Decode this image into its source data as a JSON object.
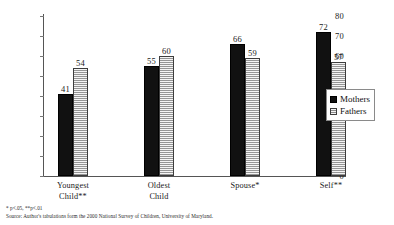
{
  "chart_data": {
    "type": "bar",
    "title": "",
    "subtitle": "",
    "xlabel": "",
    "ylabel": "",
    "ylim": [
      0,
      80
    ],
    "ytick_step": 10,
    "yticks": [
      80,
      70,
      60,
      50,
      40,
      30,
      20,
      10,
      0
    ],
    "grid": false,
    "legend_position": "right",
    "categories": [
      "Youngest Child**",
      "Oldest Child",
      "Spouse*",
      "Self**"
    ],
    "category_lines": [
      [
        "Youngest",
        "Child**"
      ],
      [
        "Oldest",
        "Child"
      ],
      [
        "Spouse*",
        ""
      ],
      [
        "Self**",
        ""
      ]
    ],
    "series": [
      {
        "name": "Mothers",
        "color": "#111111",
        "values": [
          41,
          55,
          66,
          72
        ]
      },
      {
        "name": "Fathers",
        "color": "#b9b9b9",
        "values": [
          54,
          60,
          59,
          57
        ]
      }
    ],
    "annotations": [
      "* p<.05,  **p<.01",
      "Source:  Author's tabulations form the 2000 National Survey of Children, University of Maryland."
    ]
  },
  "legend": {
    "items": [
      {
        "label": "Mothers"
      },
      {
        "label": "Fathers"
      }
    ]
  },
  "footnotes": {
    "significance": "* p<.05,  **p<.01",
    "source": "Source:  Author's tabulations form the 2000 National Survey of Children, University of Maryland."
  }
}
